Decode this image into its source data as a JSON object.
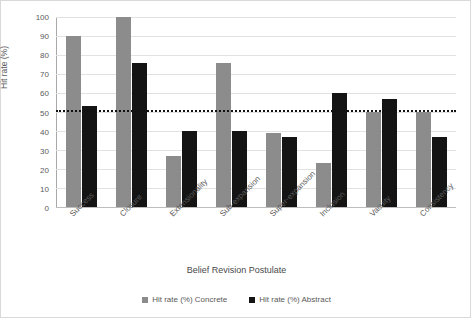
{
  "chart_data": {
    "type": "bar",
    "title": "",
    "xlabel": "Belief Revision Postulate",
    "ylabel": "Hit rate (%)",
    "ylim": [
      0,
      100
    ],
    "ytick_step": 10,
    "yticks": [
      100,
      90,
      80,
      70,
      60,
      50,
      40,
      30,
      20,
      10,
      0
    ],
    "grid": true,
    "legend_position": "bottom",
    "categories": [
      "Success",
      "Closure",
      "Extensionality",
      "Sub-expansion",
      "Super-expansion",
      "Inclusion",
      "Vacuity",
      "Consistency"
    ],
    "series": [
      {
        "name": "Hit rate (%) Concrete",
        "color": "#8c8c8c",
        "values": [
          90,
          100,
          27,
          76,
          39,
          23,
          50,
          50
        ]
      },
      {
        "name": "Hit rate (%) Abstract",
        "color": "#141414",
        "values": [
          53,
          76,
          40,
          40,
          37,
          60,
          57,
          37
        ]
      }
    ],
    "annotations": [
      {
        "type": "hline",
        "name": "chance-level-threshold",
        "value": 50,
        "style": "dotted",
        "color": "#111111"
      }
    ]
  }
}
